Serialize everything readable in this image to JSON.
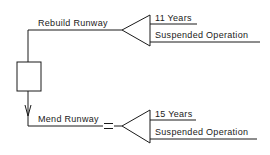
{
  "diagram": {
    "type": "decision-tree",
    "line_color": "#1a1a1a",
    "background": "#ffffff",
    "decision_node": {
      "shape": "square"
    },
    "branches": [
      {
        "label": "Rebuild Runway",
        "chance_node": {
          "shape": "triangle"
        },
        "outcomes": [
          {
            "label": "11 Years"
          },
          {
            "label": "Suspended Operation"
          }
        ]
      },
      {
        "label": "Mend Runway",
        "marker": "double-dash (chosen path)",
        "chance_node": {
          "shape": "triangle"
        },
        "outcomes": [
          {
            "label": "15 Years"
          },
          {
            "label": "Suspended Operation"
          }
        ]
      }
    ]
  }
}
